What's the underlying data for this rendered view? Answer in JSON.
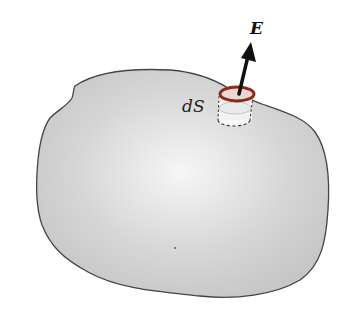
{
  "diagram": {
    "labels": {
      "field_vector": "E",
      "surface_element": "dS"
    },
    "colors": {
      "surface_fill_center": "#f4f4f4",
      "surface_fill_edge": "#c8c8c8",
      "surface_outline": "#444444",
      "pillbox_rim": "#8b2a1e",
      "arrow": "#111111"
    }
  }
}
